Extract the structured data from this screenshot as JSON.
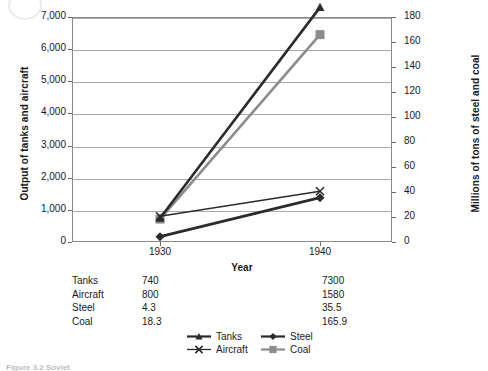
{
  "chart_data": {
    "type": "line",
    "title": "",
    "xlabel": "Year",
    "categories": [
      "1930",
      "1940"
    ],
    "x": [
      1930,
      1940
    ],
    "grid": true,
    "legend_position": "bottom",
    "axes": {
      "left": {
        "label": "Output of tanks and aircraft",
        "ylim": [
          0,
          7000
        ],
        "tick_step": 1000,
        "ticks": [
          "0",
          "1,000",
          "2,000",
          "3,000",
          "4,000",
          "5,000",
          "6,000",
          "7,000"
        ]
      },
      "right": {
        "label": "Millions of tons of steel and coal",
        "ylim": [
          0,
          180
        ],
        "tick_step": 20,
        "ticks": [
          "0",
          "20",
          "40",
          "60",
          "80",
          "100",
          "120",
          "140",
          "160",
          "180"
        ]
      }
    },
    "series": [
      {
        "name": "Tanks",
        "axis": "left",
        "values": [
          740,
          7300
        ],
        "marker": "triangle",
        "color": "#2b2b2b"
      },
      {
        "name": "Aircraft",
        "axis": "left",
        "values": [
          800,
          1580
        ],
        "marker": "x",
        "color": "#2b2b2b"
      },
      {
        "name": "Steel",
        "axis": "right",
        "values": [
          4.3,
          35.5
        ],
        "marker": "diamond",
        "color": "#2b2b2b"
      },
      {
        "name": "Coal",
        "axis": "right",
        "values": [
          18.3,
          165.9
        ],
        "marker": "square",
        "color": "#8c8c8c"
      }
    ]
  },
  "table": {
    "rows": [
      {
        "name": "Tanks",
        "v1930": "740",
        "v1940": "7300"
      },
      {
        "name": "Aircraft",
        "v1930": "800",
        "v1940": "1580"
      },
      {
        "name": "Steel",
        "v1930": "4.3",
        "v1940": "35.5"
      },
      {
        "name": "Coal",
        "v1930": "18.3",
        "v1940": "165.9"
      }
    ]
  },
  "legend": {
    "items": [
      {
        "label": "Tanks",
        "marker": "triangle",
        "color": "#2b2b2b"
      },
      {
        "label": "Steel",
        "marker": "diamond",
        "color": "#2b2b2b"
      },
      {
        "label": "Aircraft",
        "marker": "x",
        "color": "#2b2b2b"
      },
      {
        "label": "Coal",
        "marker": "square",
        "color": "#8c8c8c"
      }
    ]
  },
  "caption": "Figure 3.2  Soviet"
}
